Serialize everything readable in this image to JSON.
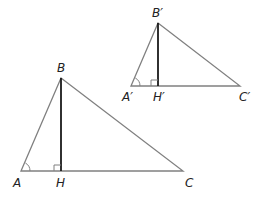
{
  "diagram": {
    "large_triangle": {
      "vertices": {
        "A": "A",
        "B": "B",
        "C": "C",
        "H": "H"
      },
      "points": {
        "A": [
          21,
          171
        ],
        "B": [
          61,
          78
        ],
        "C": [
          183,
          171
        ],
        "H": [
          61,
          171
        ]
      }
    },
    "small_triangle": {
      "vertices": {
        "A": "A′",
        "B": "B′",
        "C": "C′",
        "H": "H′"
      },
      "points": {
        "A": [
          131,
          86
        ],
        "B": [
          158,
          23
        ],
        "C": [
          240,
          86
        ],
        "H": [
          158,
          86
        ]
      }
    },
    "colors": {
      "side": "#808080",
      "altitude": "#1a1a1a"
    }
  }
}
